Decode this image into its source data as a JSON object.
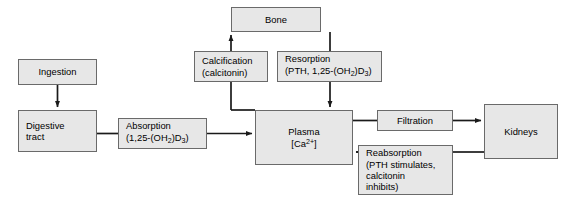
{
  "diagram": {
    "box_fill": "#e7e7e7",
    "box_border": "#6a6a6a",
    "line_color": "#1a1a1a",
    "background": "#ffffff",
    "nodes": {
      "ingestion": {
        "label": "Ingestion"
      },
      "digestive_tract": {
        "line1": "Digestive",
        "line2": "tract"
      },
      "absorption": {
        "line1": "Absorption",
        "line2_prefix": "(1,25-(OH",
        "line2_sub1": "2",
        "line2_mid": ")D",
        "line2_sub2": "3",
        "line2_suffix": ")"
      },
      "plasma": {
        "line1": "Plasma",
        "line2_prefix": "[Ca",
        "line2_sup": "2+",
        "line2_suffix": "]"
      },
      "bone": {
        "label": "Bone"
      },
      "calcification": {
        "line1": "Calcification",
        "line2": "(calcitonin)"
      },
      "resorption": {
        "line1": "Resorption",
        "line2_prefix": "(PTH, 1,25-(OH",
        "line2_sub1": "2",
        "line2_mid": ")D",
        "line2_sub2": "3",
        "line2_suffix": ")"
      },
      "filtration": {
        "label": "Filtration"
      },
      "reabsorption": {
        "line1": "Reabsorption",
        "line2": "(PTH stimulates,",
        "line3": "calcitonin",
        "line4": "inhibits)"
      },
      "kidneys": {
        "label": "Kidneys"
      }
    },
    "edges": [
      {
        "name": "ingestion-to-digestive-tract",
        "from": "ingestion",
        "to": "digestive_tract",
        "arrow": true
      },
      {
        "name": "digestive-tract-to-absorption",
        "from": "digestive_tract",
        "to": "absorption",
        "arrow": false
      },
      {
        "name": "absorption-to-plasma",
        "from": "absorption",
        "to": "plasma",
        "arrow": true
      },
      {
        "name": "plasma-to-calcification",
        "from": "plasma",
        "to": "calcification",
        "arrow": false
      },
      {
        "name": "calcification-to-bone",
        "from": "calcification",
        "to": "bone",
        "arrow": true
      },
      {
        "name": "bone-to-resorption",
        "from": "bone",
        "to": "resorption",
        "arrow": false
      },
      {
        "name": "resorption-to-plasma",
        "from": "resorption",
        "to": "plasma",
        "arrow": true
      },
      {
        "name": "plasma-to-filtration",
        "from": "plasma",
        "to": "filtration",
        "arrow": false
      },
      {
        "name": "filtration-to-kidneys",
        "from": "filtration",
        "to": "kidneys",
        "arrow": true
      },
      {
        "name": "kidneys-to-reabsorption",
        "from": "kidneys",
        "to": "reabsorption",
        "arrow": false
      },
      {
        "name": "reabsorption-to-plasma",
        "from": "reabsorption",
        "to": "plasma",
        "arrow": true
      }
    ]
  }
}
